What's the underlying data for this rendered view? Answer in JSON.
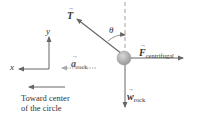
{
  "diagram": {
    "type": "free-body-diagram",
    "object": "rock",
    "labels": {
      "tension": "T",
      "angle": "θ",
      "centrifugal_vec": "F",
      "centrifugal_sub": "centrifugal",
      "weight_vec": "w",
      "weight_sub": "rock",
      "accel_vec": "a",
      "accel_sub": "rock",
      "axis_x": "x",
      "axis_y": "y",
      "caption_line1": "Toward center",
      "caption_line2": "of the circle"
    },
    "colors": {
      "arrow": "#666666",
      "accel_arrow": "#aaaaaa",
      "rock_fill": "#b5b5b5",
      "text": "#333333",
      "dashed_line": "#888888"
    }
  }
}
